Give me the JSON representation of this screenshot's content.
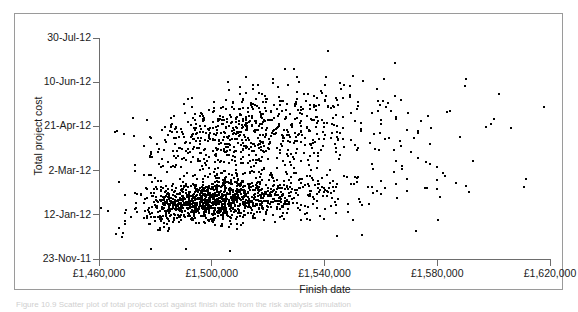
{
  "figure": {
    "caption_fragment": "Figure 10.9 Scatter plot of total project cost against finish date from the risk analysis simulation"
  },
  "chart_data": {
    "type": "scatter",
    "title": "",
    "xlabel": "Finish date",
    "ylabel": "Total project cost",
    "grid": false,
    "legend": "none",
    "marker": {
      "shape": "square",
      "color": "#000000",
      "size_px": 2
    },
    "x_axis": {
      "tick_labels": [
        "£1,460,000",
        "£1,500,000",
        "£1,540,000",
        "£1,580,000",
        "£1,620,000"
      ],
      "tick_values": [
        1460000,
        1500000,
        1540000,
        1580000,
        1620000
      ],
      "xlim": [
        1460000,
        1620000
      ]
    },
    "y_axis": {
      "tick_labels": [
        "23-Nov-11",
        "12-Jan-12",
        "2-Mar-12",
        "21-Apr-12",
        "10-Jun-12",
        "30-Jul-12"
      ],
      "tick_day_offsets": [
        0,
        50,
        100,
        150,
        200,
        250
      ],
      "ylim_day_offsets": [
        0,
        250
      ]
    },
    "n_points": 2000,
    "distribution": {
      "description": "Dense elongated cloud of simulation outcomes, positively skewed in cost with a long right tail and a secondary upper lobe; correlation between cost and finish date is weakly positive.",
      "clusters": [
        {
          "weight": 0.56,
          "x_mean": 1502000,
          "x_sd": 13000,
          "y_mean": 68,
          "y_sd": 13,
          "rho": 0.3
        },
        {
          "weight": 0.3,
          "x_mean": 1512000,
          "x_sd": 17000,
          "y_mean": 148,
          "y_sd": 25,
          "rho": 0.35
        },
        {
          "weight": 0.14,
          "x_mean": 1528000,
          "x_sd": 24000,
          "y_mean": 110,
          "y_sd": 38,
          "rho": 0.2
        }
      ],
      "seed": 20121
    }
  }
}
